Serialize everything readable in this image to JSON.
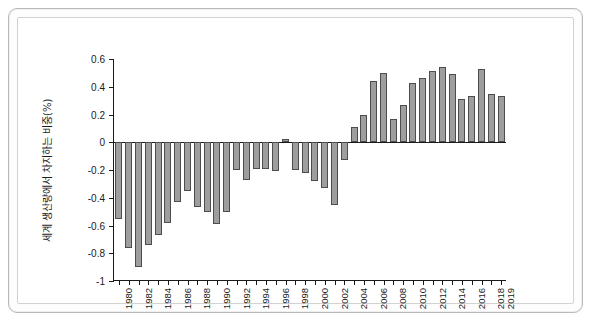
{
  "chart_data": {
    "type": "bar",
    "title": "",
    "xlabel": "",
    "ylabel": "세계 생산량에서 차지하는 비중(%)",
    "ylim": [
      -1,
      0.6
    ],
    "xlim": [
      1980,
      2019
    ],
    "grid": false,
    "legend": null,
    "bar_color": "#9e9e9e",
    "bar_edge_color": "#4d4d4d",
    "ytick_labels": [
      "0.6",
      "0.4",
      "0.2",
      "0",
      "-0.2",
      "-0.4",
      "-0.6",
      "-0.8",
      "-1"
    ],
    "ytick_values": [
      0.6,
      0.4,
      0.2,
      0,
      -0.2,
      -0.4,
      -0.6,
      -0.8,
      -1
    ],
    "xtick_labels": [
      "1980",
      "1982",
      "1984",
      "1986",
      "1988",
      "1990",
      "1992",
      "1994",
      "1996",
      "1998",
      "2000",
      "2002",
      "2004",
      "2006",
      "2008",
      "2010",
      "2012",
      "2014",
      "2016",
      "2018",
      "2019"
    ],
    "categories": [
      "1980",
      "1981",
      "1982",
      "1983",
      "1984",
      "1985",
      "1986",
      "1987",
      "1988",
      "1989",
      "1990",
      "1991",
      "1992",
      "1993",
      "1994",
      "1995",
      "1996",
      "1997",
      "1998",
      "1999",
      "2000",
      "2001",
      "2002",
      "2003",
      "2004",
      "2005",
      "2006",
      "2007",
      "2008",
      "2009",
      "2010",
      "2011",
      "2012",
      "2013",
      "2014",
      "2015",
      "2016",
      "2017",
      "2018",
      "2019"
    ],
    "values": [
      -0.55,
      -0.76,
      -0.9,
      -0.74,
      -0.67,
      -0.58,
      -0.43,
      -0.35,
      -0.47,
      -0.5,
      -0.59,
      -0.5,
      -0.2,
      -0.27,
      -0.19,
      -0.19,
      -0.21,
      0.02,
      -0.2,
      -0.22,
      -0.28,
      -0.33,
      -0.45,
      -0.13,
      0.11,
      0.195,
      0.44,
      0.5,
      0.165,
      0.265,
      0.43,
      0.465,
      0.51,
      0.545,
      0.49,
      0.315,
      0.335,
      0.53,
      0.35,
      0.33
    ]
  }
}
